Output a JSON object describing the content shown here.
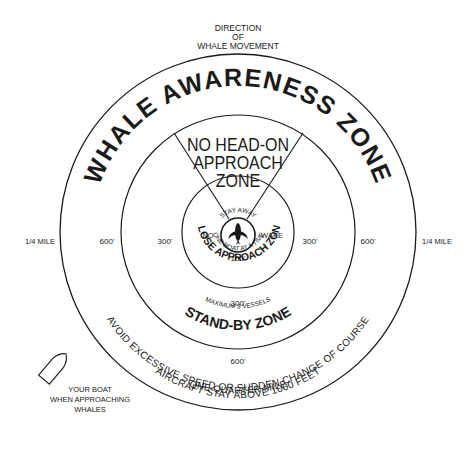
{
  "direction_label": {
    "line1": "DIRECTION",
    "line2": "OF",
    "line3": "WHALE MOVEMENT"
  },
  "zones": {
    "awareness": "WHALE AWARENESS ZONE",
    "no_head_on": {
      "line1": "NO HEAD-ON",
      "line2": "APPROACH",
      "line3": "ZONE"
    },
    "close_approach": "CLOSE APPROACH ZONE",
    "stand_by": "STAND-BY ZONE"
  },
  "close_zone_notes": {
    "stay_away": "STAY AWAY",
    "no": "NO",
    "wake": "WAKE",
    "one_boat": "ONE BOAT AT A TIME",
    "distance": "100'"
  },
  "stand_by_notes": {
    "max_vessels": "MAXIMUM 3 VESSELS"
  },
  "distances": {
    "left_mile": "1/4 MILE",
    "right_mile": "1/4 MILE",
    "left_600": "600'",
    "right_600": "600'",
    "left_300": "300'",
    "right_300": "300'",
    "bottom_300": "300'",
    "bottom_600": "600'",
    "bottom_mile": "ONE QUARTER MILE"
  },
  "rules": {
    "speed": "AVOID EXCESSIVE SPEED OR SUDDEN CHANGE OF COURSE",
    "aircraft": "AIRCRAFT STAY ABOVE 1000 FEET"
  },
  "boat_legend": {
    "line1": "YOUR BOAT",
    "line2": "WHEN APPROACHING",
    "line3": "WHALES"
  },
  "icons": {
    "whale": "whale-icon",
    "boat": "boat-icon"
  },
  "colors": {
    "ink": "#1a1a1a",
    "background": "#ffffff"
  }
}
